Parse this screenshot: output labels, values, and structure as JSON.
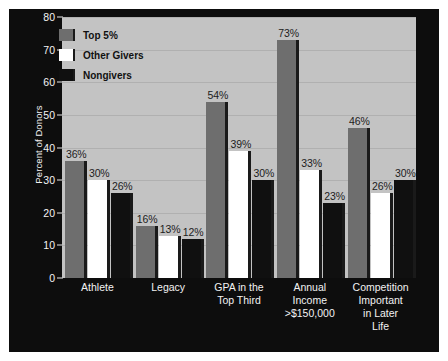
{
  "chart_data": {
    "type": "bar",
    "title": "",
    "subtitle": "",
    "xlabel": "",
    "ylabel": "Percent of Donors",
    "ylim": [
      0,
      80
    ],
    "ytick_values": [
      0,
      10,
      20,
      30,
      40,
      50,
      60,
      70,
      80
    ],
    "ytick_labels": [
      "0",
      "10",
      "20",
      "30",
      "40",
      "50",
      "60",
      "70",
      "80"
    ],
    "grid": true,
    "legend_position": "top-left-inside",
    "value_label_suffix": "%",
    "categories": [
      "Athlete",
      "Legacy",
      "GPA in the\nTop Third",
      "Annual\nIncome\n>$150,000",
      "Competition\nImportant\nin Later\nLife"
    ],
    "series": [
      {
        "name": "Top 5%",
        "color": "#6e6e6e",
        "values": [
          36,
          16,
          54,
          73,
          46
        ],
        "labels": [
          "36%",
          "16%",
          "54%",
          "73%",
          "46%"
        ]
      },
      {
        "name": "Other Givers",
        "color": "#ffffff",
        "values": [
          30,
          13,
          39,
          33,
          26
        ],
        "labels": [
          "30%",
          "13%",
          "39%",
          "33%",
          "26%"
        ]
      },
      {
        "name": "Nongivers",
        "color": "#101010",
        "values": [
          26,
          12,
          30,
          23,
          30
        ],
        "labels": [
          "26%",
          "12%",
          "30%",
          "23%",
          "30%"
        ]
      }
    ]
  },
  "colors": {
    "figure_background": "#0d0d0d",
    "plot_background": "#c3c3c3",
    "gridline": "#b0b0b0",
    "axis_text": "#f2f2f2",
    "value_label_text": "#1c1c1c",
    "legend_text": "#111111",
    "page_background": "#ffffff"
  },
  "legend": {
    "items": [
      {
        "label": "Top 5%",
        "color": "#6e6e6e"
      },
      {
        "label": "Other Givers",
        "color": "#ffffff"
      },
      {
        "label": "Nongivers",
        "color": "#101010"
      }
    ]
  },
  "y_axis": {
    "title": "Percent of Donors",
    "ticks": [
      "80",
      "70",
      "60",
      "50",
      "40",
      "30",
      "20",
      "10",
      "0"
    ]
  },
  "x_axis": {
    "labels": [
      "Athlete",
      "Legacy",
      "GPA in the\nTop Third",
      "Annual\nIncome\n>$150,000",
      "Competition\nImportant\nin Later\nLife"
    ]
  }
}
